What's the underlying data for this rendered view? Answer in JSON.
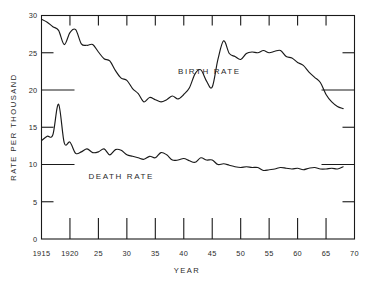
{
  "chart_data": {
    "type": "line",
    "title": "",
    "xlabel": "YEAR",
    "ylabel": "RATE PER THOUSAND",
    "xlim": [
      1915,
      1970
    ],
    "ylim": [
      0,
      30
    ],
    "grid": false,
    "legend_position": "inline-annotations",
    "y_ticks": [
      {
        "value": 0,
        "label": "0",
        "length": "short"
      },
      {
        "value": 5,
        "label": "5",
        "length": "short"
      },
      {
        "value": 10,
        "label": "10",
        "length": "long"
      },
      {
        "value": 15,
        "label": "15",
        "length": "short"
      },
      {
        "value": 20,
        "label": "20",
        "length": "long"
      },
      {
        "value": 25,
        "label": "25",
        "length": "short"
      },
      {
        "value": 30,
        "label": "30",
        "length": "short"
      }
    ],
    "x_ticks": [
      {
        "value": 1915,
        "label": "1915"
      },
      {
        "value": 1920,
        "label": "1920"
      },
      {
        "value": 1925,
        "label": "25"
      },
      {
        "value": 1930,
        "label": "30"
      },
      {
        "value": 1935,
        "label": "35"
      },
      {
        "value": 1940,
        "label": "40"
      },
      {
        "value": 1945,
        "label": "45"
      },
      {
        "value": 1950,
        "label": "50"
      },
      {
        "value": 1955,
        "label": "55"
      },
      {
        "value": 1960,
        "label": "60"
      },
      {
        "value": 1965,
        "label": "65"
      },
      {
        "value": 1970,
        "label": "70"
      }
    ],
    "annotations": [
      {
        "text": "BIRTH RATE",
        "x": 1944.5,
        "y": 22.2
      },
      {
        "text": "DEATH RATE",
        "x": 1929.0,
        "y": 8.1
      }
    ],
    "series": [
      {
        "name": "BIRTH RATE",
        "color": "#1a1a1a",
        "x": [
          1915,
          1916,
          1917,
          1918,
          1919,
          1920,
          1921,
          1922,
          1923,
          1924,
          1925,
          1926,
          1927,
          1928,
          1929,
          1930,
          1931,
          1932,
          1933,
          1934,
          1935,
          1936,
          1937,
          1938,
          1939,
          1940,
          1941,
          1942,
          1943,
          1944,
          1945,
          1946,
          1947,
          1948,
          1949,
          1950,
          1951,
          1952,
          1953,
          1954,
          1955,
          1956,
          1957,
          1958,
          1959,
          1960,
          1961,
          1962,
          1963,
          1964,
          1965,
          1966,
          1967,
          1968
        ],
        "values": [
          29.5,
          29.1,
          28.5,
          28.0,
          26.1,
          27.7,
          28.1,
          26.2,
          26.0,
          26.1,
          25.1,
          24.2,
          23.9,
          22.6,
          21.6,
          21.3,
          20.2,
          19.5,
          18.4,
          19.0,
          18.7,
          18.4,
          18.7,
          19.2,
          18.8,
          19.4,
          20.3,
          22.2,
          22.7,
          21.2,
          20.4,
          24.1,
          26.6,
          24.9,
          24.5,
          24.1,
          24.9,
          25.1,
          25.0,
          25.3,
          25.0,
          25.2,
          25.3,
          24.5,
          24.3,
          23.7,
          23.3,
          22.4,
          21.7,
          21.0,
          19.4,
          18.4,
          17.8,
          17.5
        ]
      },
      {
        "name": "DEATH RATE",
        "color": "#1a1a1a",
        "x": [
          1915,
          1916,
          1917,
          1918,
          1919,
          1920,
          1921,
          1922,
          1923,
          1924,
          1925,
          1926,
          1927,
          1928,
          1929,
          1930,
          1931,
          1932,
          1933,
          1934,
          1935,
          1936,
          1937,
          1938,
          1939,
          1940,
          1941,
          1942,
          1943,
          1944,
          1945,
          1946,
          1947,
          1948,
          1949,
          1950,
          1951,
          1952,
          1953,
          1954,
          1955,
          1956,
          1957,
          1958,
          1959,
          1960,
          1961,
          1962,
          1963,
          1964,
          1965,
          1966,
          1967,
          1968
        ],
        "values": [
          13.2,
          13.8,
          14.0,
          18.1,
          12.9,
          13.0,
          11.5,
          11.7,
          12.1,
          11.6,
          11.7,
          12.1,
          11.3,
          12.0,
          11.9,
          11.3,
          11.1,
          10.9,
          10.7,
          11.1,
          10.9,
          11.6,
          11.3,
          10.6,
          10.6,
          10.8,
          10.5,
          10.3,
          10.9,
          10.6,
          10.6,
          10.0,
          10.1,
          9.9,
          9.7,
          9.6,
          9.7,
          9.6,
          9.6,
          9.2,
          9.3,
          9.4,
          9.6,
          9.5,
          9.4,
          9.5,
          9.3,
          9.5,
          9.6,
          9.4,
          9.4,
          9.5,
          9.4,
          9.7
        ],
        "final_segment": {
          "label": "flat tail",
          "y": 10.5
        }
      }
    ]
  },
  "axes": {
    "y_axis_title": "RATE PER THOUSAND",
    "x_axis_title": "YEAR"
  }
}
